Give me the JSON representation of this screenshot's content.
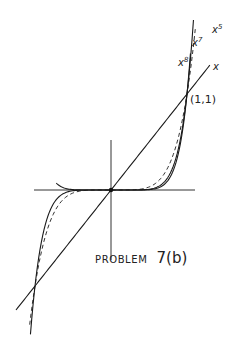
{
  "diagram": {
    "title": "PROBLEM 7(b)",
    "caption_word": "PROBLEM",
    "caption_number": "7(b)",
    "point_label": "(1,1)",
    "origin_px": [
      111,
      190
    ],
    "unit_px": [
      76,
      96
    ],
    "axes": {
      "x_axis": {
        "from_px": 34,
        "to_px": 195
      },
      "y_axis": {
        "from_px": 140,
        "to_px": 260
      }
    },
    "curves": [
      {
        "name": "x",
        "label": "x",
        "exponent": 1,
        "style": "solid",
        "x_range": [
          -1.25,
          1.3
        ],
        "label_pos": [
          213,
          70
        ]
      },
      {
        "name": "x^5",
        "label": "x",
        "sup": "5",
        "exponent": 5,
        "style": "dashed",
        "x_range": [
          -1.07,
          1.11
        ],
        "label_pos": [
          212,
          33
        ]
      },
      {
        "name": "x^7",
        "label": "x",
        "sup": "7",
        "exponent": 7,
        "style": "solid",
        "x_range": [
          -1.06,
          1.085
        ],
        "label_pos": [
          192,
          46
        ]
      },
      {
        "name": "x^8",
        "label": "x",
        "sup": "8",
        "exponent": 8,
        "style": "solid",
        "x_range": [
          -0.72,
          1.045
        ],
        "label_pos": [
          178,
          66
        ]
      }
    ],
    "intersection_points": [
      {
        "label": "(1,1)",
        "x": 1,
        "y": 1
      },
      {
        "label": "",
        "x": -1,
        "y": -1
      },
      {
        "label": "",
        "x": 0,
        "y": 0
      }
    ]
  }
}
